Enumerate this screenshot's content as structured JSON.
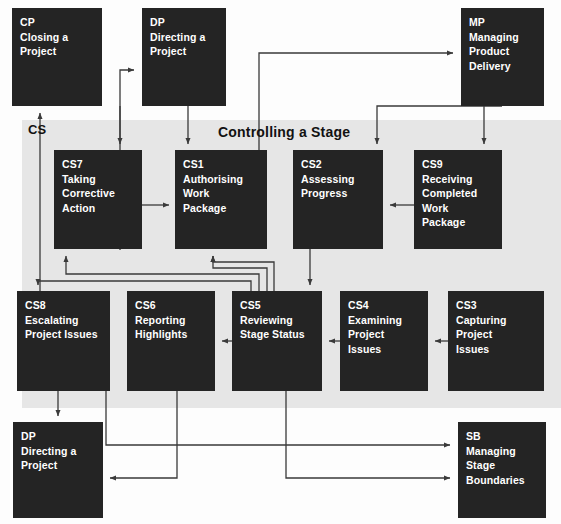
{
  "diagram": {
    "band_title": "Controlling a Stage",
    "band_label": "CS",
    "band_color": "#e6e6e6",
    "node_color": "#242424",
    "node_text_color": "#ffffff",
    "connector_color": "#3a3a3a"
  },
  "nodes": [
    {
      "id": "CP",
      "code": "CP",
      "lines": [
        "CP",
        "Closing a",
        "Project"
      ],
      "x": 12,
      "y": 8,
      "w": 90,
      "h": 98
    },
    {
      "id": "DPT",
      "code": "DP",
      "lines": [
        "DP",
        "Directing a",
        "Project"
      ],
      "x": 142,
      "y": 8,
      "w": 84,
      "h": 98
    },
    {
      "id": "MP",
      "code": "MP",
      "lines": [
        "MP",
        "Managing",
        "Product",
        "Delivery"
      ],
      "x": 461,
      "y": 8,
      "w": 83,
      "h": 98
    },
    {
      "id": "CS7",
      "code": "CS7",
      "lines": [
        "CS7",
        "Taking",
        "Corrective",
        "Action"
      ],
      "x": 54,
      "y": 150,
      "w": 88,
      "h": 99
    },
    {
      "id": "CS1",
      "code": "CS1",
      "lines": [
        "CS1",
        "Authorising",
        "Work",
        "Package"
      ],
      "x": 175,
      "y": 150,
      "w": 92,
      "h": 99
    },
    {
      "id": "CS2",
      "code": "CS2",
      "lines": [
        "CS2",
        "Assessing",
        "Progress"
      ],
      "x": 293,
      "y": 150,
      "w": 90,
      "h": 99
    },
    {
      "id": "CS9",
      "code": "CS9",
      "lines": [
        "CS9",
        "Receiving",
        "Completed",
        "Work",
        "Package"
      ],
      "x": 414,
      "y": 150,
      "w": 88,
      "h": 99
    },
    {
      "id": "CS8",
      "code": "CS8",
      "lines": [
        "CS8",
        "Escalating",
        "Project Issues"
      ],
      "x": 17,
      "y": 291,
      "w": 93,
      "h": 100
    },
    {
      "id": "CS6",
      "code": "CS6",
      "lines": [
        "CS6",
        "Reporting",
        "Highlights"
      ],
      "x": 127,
      "y": 291,
      "w": 88,
      "h": 100
    },
    {
      "id": "CS5",
      "code": "CS5",
      "lines": [
        "CS5",
        "Reviewing",
        "Stage Status"
      ],
      "x": 232,
      "y": 291,
      "w": 90,
      "h": 100
    },
    {
      "id": "CS4",
      "code": "CS4",
      "lines": [
        "CS4",
        "Examining",
        "Project",
        "Issues"
      ],
      "x": 340,
      "y": 291,
      "w": 88,
      "h": 100
    },
    {
      "id": "CS3",
      "code": "CS3",
      "lines": [
        "CS3",
        "Capturing",
        "Project",
        "Issues"
      ],
      "x": 448,
      "y": 291,
      "w": 96,
      "h": 100
    },
    {
      "id": "DPB",
      "code": "DP",
      "lines": [
        "DP",
        "Directing a",
        "Project"
      ],
      "x": 13,
      "y": 422,
      "w": 90,
      "h": 96
    },
    {
      "id": "SB",
      "code": "SB",
      "lines": [
        "SB",
        "Managing",
        "Stage",
        "Boundaries"
      ],
      "x": 458,
      "y": 422,
      "w": 88,
      "h": 96
    }
  ],
  "band": {
    "x": 22,
    "y": 120,
    "w": 539,
    "h": 288
  },
  "band_title_pos": {
    "x": 218,
    "y": 124
  },
  "band_label_pos": {
    "x": 28,
    "y": 122
  },
  "connectors": [
    {
      "name": "cs8-to-cp",
      "from": "CS8",
      "to": "CP",
      "path": "M 40 291 L 40 113"
    },
    {
      "name": "cs7-to-dp-top",
      "from": "CS7",
      "to": "DPT",
      "path": "M 120 250 L 120 70 L 134 70"
    },
    {
      "name": "dp-to-cs7",
      "from": "DPT",
      "to": "CS7",
      "path": "M 120 106 L 120 144"
    },
    {
      "name": "dp-to-cs1",
      "from": "DPT",
      "to": "CS1",
      "path": "M 188 106 L 188 144"
    },
    {
      "name": "cs1-to-mp",
      "from": "CS1",
      "to": "MP",
      "path": "M 259 150 L 259 53 L 453 53"
    },
    {
      "name": "mp-to-cs2",
      "from": "MP",
      "to": "CS2",
      "path": "M 502 106 L 377 106 L 377 144"
    },
    {
      "name": "mp-to-cs9",
      "from": "MP",
      "to": "CS9",
      "path": "M 484 106 L 484 144"
    },
    {
      "name": "cs9-to-cs2",
      "from": "CS9",
      "to": "CS2",
      "path": "M 414 205 L 390 205"
    },
    {
      "name": "cs7-to-cs1",
      "from": "CS7",
      "to": "CS1",
      "path": "M 142 205 L 169 205"
    },
    {
      "name": "cs2-to-cs5",
      "from": "CS2",
      "to": "CS5",
      "path": "M 310 249 L 310 285"
    },
    {
      "name": "cs5-to-cs1-a",
      "from": "CS5",
      "to": "CS1",
      "path": "M 274 291 L 274 262 L 213 262 L 213 256"
    },
    {
      "name": "cs5-to-cs1-b",
      "from": "CS5",
      "to": "CS1",
      "path": "M 267 291 L 267 268 L 213 268 L 213 256"
    },
    {
      "name": "cs5-to-cs7",
      "from": "CS5",
      "to": "CS7",
      "path": "M 259 291 L 259 274 L 66 274 L 66 256"
    },
    {
      "name": "cs5-to-cs8",
      "from": "CS5",
      "to": "CS8",
      "path": "M 251 291 L 251 281 L 38 281 L 38 285"
    },
    {
      "name": "cs4-to-cs5",
      "from": "CS4",
      "to": "CS5",
      "path": "M 340 341 L 329 341"
    },
    {
      "name": "cs3-to-cs4",
      "from": "CS3",
      "to": "CS4",
      "path": "M 448 341 L 435 341"
    },
    {
      "name": "cs5-to-cs6",
      "from": "CS5",
      "to": "CS6",
      "path": "M 232 341 L 222 341"
    },
    {
      "name": "cs8-dp-bottom",
      "from": "CS8",
      "to": "DPB",
      "path": "M 58 391 L 58 416",
      "double": true
    },
    {
      "name": "cs8-to-sb",
      "from": "CS8",
      "to": "SB",
      "path": "M 106 391 L 106 445 L 450 445"
    },
    {
      "name": "cs6-to-dp",
      "from": "CS6",
      "to": "DPB",
      "path": "M 177 391 L 177 478 L 110 478"
    },
    {
      "name": "cs5-to-sb",
      "from": "CS5",
      "to": "SB",
      "path": "M 286 391 L 286 478 L 450 478"
    }
  ]
}
